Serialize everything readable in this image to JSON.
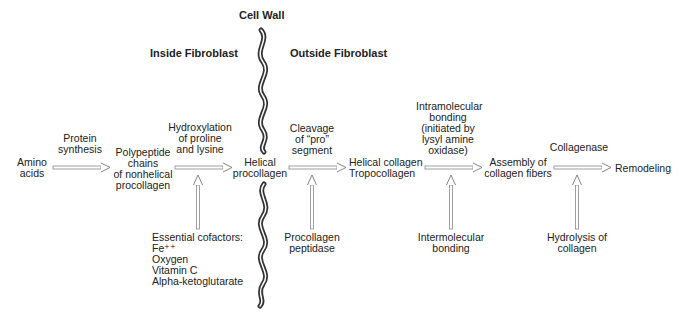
{
  "headers": {
    "cell_wall": "Cell Wall",
    "inside": "Inside Fibroblast",
    "outside": "Outside Fibroblast"
  },
  "nodes": {
    "amino_acids": [
      "Amino",
      "acids"
    ],
    "polypeptide": [
      "Polypeptide",
      "chains",
      "of nonhelical",
      "procollagen"
    ],
    "helical_procollagen": [
      "Helical",
      "procollagen"
    ],
    "helical_collagen": [
      "Helical collagen",
      "Tropocollagen"
    ],
    "assembly": [
      "Assembly of",
      "collagen fibers"
    ],
    "remodeling": [
      "Remodeling"
    ]
  },
  "process_labels": {
    "protein_synthesis": [
      "Protein",
      "synthesis"
    ],
    "hydroxylation": [
      "Hydroxylation",
      "of proline",
      "and lysine"
    ],
    "cleavage": [
      "Cleavage",
      "of “pro”",
      "segment"
    ],
    "intramolecular": [
      "Intramolecular",
      "bonding",
      "(initiated by",
      "lysyl amine",
      "oxidase)"
    ],
    "collagenase": [
      "Collagenase"
    ]
  },
  "inputs": {
    "cofactors": [
      "Essential cofactors:",
      "Fe⁺⁺",
      "Oxygen",
      "Vitamin C",
      "Alpha-ketoglutarate"
    ],
    "procollagen_peptidase": [
      "Procollagen",
      "peptidase"
    ],
    "intermolecular": [
      "Intermolecular",
      "bonding"
    ],
    "hydrolysis": [
      "Hydrolysis of",
      "collagen"
    ]
  },
  "colors": {
    "text": "#222222",
    "arrow": "#888888",
    "wall": "#333333"
  }
}
